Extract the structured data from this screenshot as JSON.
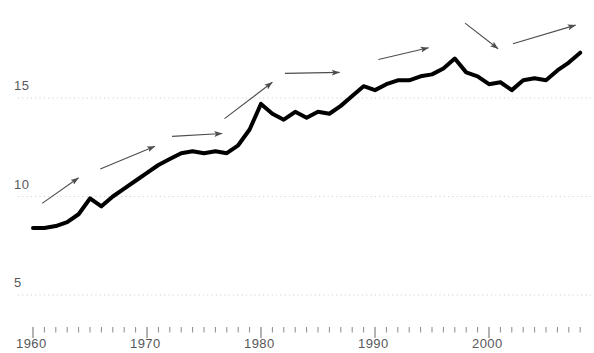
{
  "chart_data": {
    "type": "line",
    "title": "",
    "subtitle": "",
    "xlabel": "",
    "ylabel": "",
    "xlim": [
      1960,
      2009
    ],
    "ylim": [
      3.3,
      18.5
    ],
    "grid": "horizontal-dotted",
    "legend": "none",
    "y_ticks": [
      5,
      10,
      15
    ],
    "y_tick_labels": [
      "5",
      "10",
      "15"
    ],
    "x_ticks": [
      1960,
      1970,
      1980,
      1990,
      2000
    ],
    "x_tick_labels": [
      "1960",
      "1970",
      "1980",
      "1990",
      "2000"
    ],
    "x_minor_tick_interval": 1,
    "series": [
      {
        "name": "value",
        "color": "#000000",
        "line_width": 4,
        "x": [
          1960,
          1961,
          1962,
          1963,
          1964,
          1965,
          1966,
          1967,
          1968,
          1969,
          1970,
          1971,
          1972,
          1973,
          1974,
          1975,
          1976,
          1977,
          1978,
          1979,
          1980,
          1981,
          1982,
          1983,
          1984,
          1985,
          1986,
          1987,
          1988,
          1989,
          1990,
          1991,
          1992,
          1993,
          1994,
          1995,
          1996,
          1997,
          1998,
          1999,
          2000,
          2001,
          2002,
          2003,
          2004,
          2005,
          2006,
          2007,
          2008
        ],
        "values": [
          8.4,
          8.4,
          8.5,
          8.7,
          9.1,
          9.9,
          9.5,
          10.0,
          10.4,
          10.8,
          11.2,
          11.6,
          11.9,
          12.2,
          12.3,
          12.2,
          12.3,
          12.2,
          12.6,
          13.4,
          14.7,
          14.2,
          13.9,
          14.3,
          14.0,
          14.3,
          14.2,
          14.6,
          15.1,
          15.6,
          15.4,
          15.7,
          15.9,
          15.9,
          16.1,
          16.2,
          16.5,
          17.0,
          16.3,
          16.1,
          15.7,
          15.8,
          15.4,
          15.9,
          16.0,
          15.9,
          16.4,
          16.8,
          17.3
        ]
      }
    ],
    "annotations": [
      {
        "type": "arrow",
        "label": "trend-arrow-1",
        "x1": 1960.8,
        "y1": 9.65,
        "x2": 1964.0,
        "y2": 10.95
      },
      {
        "type": "arrow",
        "label": "trend-arrow-2",
        "x1": 1965.9,
        "y1": 11.4,
        "x2": 1970.7,
        "y2": 12.55
      },
      {
        "type": "arrow",
        "label": "trend-arrow-3",
        "x1": 1972.2,
        "y1": 13.05,
        "x2": 1676.6,
        "y2": 13.2
      },
      {
        "type": "arrow",
        "label": "trend-arrow-4",
        "x1": 1976.8,
        "y1": 13.95,
        "x2": 1981.0,
        "y2": 15.8
      },
      {
        "type": "arrow",
        "label": "trend-arrow-5",
        "x1": 1982.1,
        "y1": 16.25,
        "x2": 1986.9,
        "y2": 16.3
      },
      {
        "type": "arrow",
        "label": "trend-arrow-6",
        "x1": 1990.3,
        "y1": 16.95,
        "x2": 1994.7,
        "y2": 17.55
      },
      {
        "type": "arrow",
        "label": "trend-arrow-7",
        "x1": 1997.9,
        "y1": 18.8,
        "x2": 2000.8,
        "y2": 17.5
      },
      {
        "type": "arrow",
        "label": "trend-arrow-8",
        "x1": 2002.1,
        "y1": 17.75,
        "x2": 2007.6,
        "y2": 18.7
      }
    ],
    "colors": {
      "line": "#000000",
      "grid": "#cfcfcf",
      "axis": "#8a8a8a",
      "tick_label": "#58585a",
      "arrow": "#4d4d4d"
    }
  },
  "axes": {
    "y_labels": [
      "15",
      "10",
      "5"
    ],
    "x_labels": [
      "1960",
      "1970",
      "1980",
      "1990",
      "2000"
    ]
  }
}
